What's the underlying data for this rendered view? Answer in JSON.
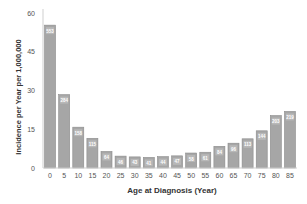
{
  "chart_data": {
    "type": "bar",
    "title": "",
    "xlabel": "Age at Diagnosis (Year)",
    "ylabel": "Incidence per Year per 1,000,000",
    "ylim": [
      0,
      60
    ],
    "yticks": [
      0,
      15,
      30,
      45,
      60
    ],
    "grid": false,
    "legend": null,
    "categories": [
      "0",
      "5",
      "10",
      "15",
      "20",
      "25",
      "30",
      "35",
      "40",
      "45",
      "50",
      "55",
      "60",
      "65",
      "70",
      "75",
      "80",
      "85"
    ],
    "values": [
      55.3,
      28.4,
      15.8,
      11.5,
      6.4,
      4.6,
      4.3,
      4.1,
      4.4,
      4.7,
      5.8,
      6.1,
      8.4,
      9.6,
      11.3,
      14.4,
      20.3,
      21.9
    ],
    "bar_labels": [
      "553",
      "284",
      "158",
      "115",
      "64",
      "46",
      "43",
      "41",
      "44",
      "47",
      "58",
      "61",
      "84",
      "96",
      "113",
      "144",
      "203",
      "219"
    ],
    "bar_color": "#a6a6a6",
    "bar_edge_color": "#8c8c8c",
    "label_color": "#ffffff"
  }
}
